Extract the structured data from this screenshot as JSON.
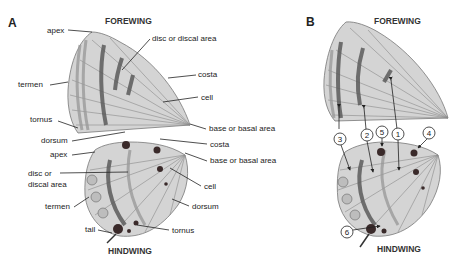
{
  "panel_a": {
    "letter": "A",
    "forewing_title": "FOREWING",
    "hindwing_title": "HINDWING",
    "forewing_labels": {
      "apex": "apex",
      "disc": "disc or discal area",
      "termen": "termen",
      "costa": "costa",
      "cell": "cell",
      "tornus": "tornus",
      "base": "base or basal area",
      "dorsum": "dorsum"
    },
    "hindwing_labels": {
      "costa": "costa",
      "apex": "apex",
      "base": "base or basal area",
      "disc_line1": "disc or",
      "disc_line2": "discal area",
      "cell": "cell",
      "termen": "termen",
      "dorsum": "dorsum",
      "tail": "tail",
      "tornus": "tornus"
    }
  },
  "panel_b": {
    "letter": "B",
    "forewing_title": "FOREWING",
    "hindwing_title": "HINDWING",
    "markers": [
      "1",
      "2",
      "3",
      "4",
      "5",
      "6"
    ]
  }
}
